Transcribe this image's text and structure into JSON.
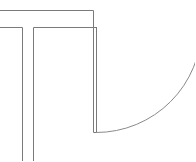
{
  "diagram": {
    "type": "architectural-floor-plan-fragment",
    "stroke_color": "#7a7a7a",
    "arc_color": "#8a8a8a",
    "background": "#ffffff",
    "elements": [
      {
        "name": "outer-wall-top-line",
        "kind": "wall"
      },
      {
        "name": "inner-wall-top-line",
        "kind": "wall"
      },
      {
        "name": "corridor-left-wall",
        "kind": "wall"
      },
      {
        "name": "corridor-right-wall",
        "kind": "wall"
      },
      {
        "name": "door-leaf",
        "kind": "door"
      },
      {
        "name": "door-swing-arc",
        "kind": "door-swing"
      }
    ]
  }
}
